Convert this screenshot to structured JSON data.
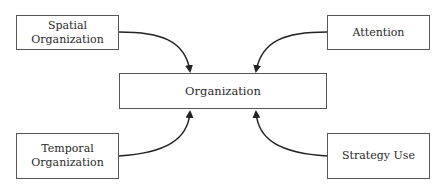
{
  "diagram": {
    "center": {
      "label": "Organization"
    },
    "nodes": [
      {
        "id": "spatial",
        "label": "Spatial Organization"
      },
      {
        "id": "attention",
        "label": "Attention"
      },
      {
        "id": "temporal",
        "label": "Temporal\nOrganization",
        "label_line1": "Temporal",
        "label_line2": "Organization"
      },
      {
        "id": "strategy",
        "label": "Strategy Use"
      }
    ],
    "edges": [
      {
        "from": "spatial",
        "to": "center"
      },
      {
        "from": "attention",
        "to": "center"
      },
      {
        "from": "temporal",
        "to": "center"
      },
      {
        "from": "strategy",
        "to": "center"
      }
    ]
  }
}
